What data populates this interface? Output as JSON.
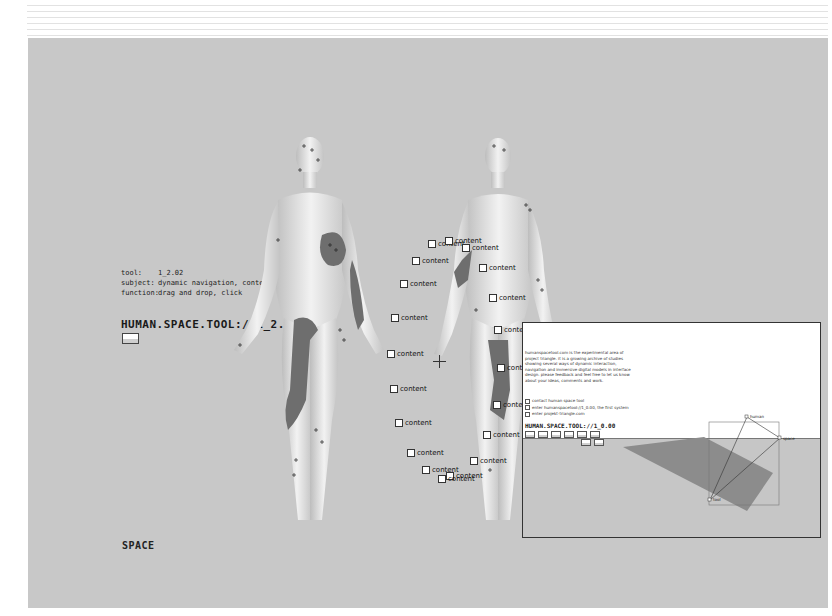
{
  "header": {
    "decoration": "horizontal-stripes"
  },
  "info": {
    "rows": [
      {
        "key": "tool:",
        "value": "1_2.02"
      },
      {
        "key": "subject:",
        "value": "dynamic navigation, contentmanagement"
      },
      {
        "key": "function:",
        "value": "drag and drop, click"
      }
    ],
    "title": "HUMAN.SPACE.TOOL://1_2.01"
  },
  "footer": {
    "label": "SPACE"
  },
  "content_nodes": [
    {
      "label": "content",
      "x": 400,
      "y": 202
    },
    {
      "label": "content",
      "x": 417,
      "y": 199
    },
    {
      "label": "content",
      "x": 434,
      "y": 206
    },
    {
      "label": "content",
      "x": 384,
      "y": 219
    },
    {
      "label": "content",
      "x": 451,
      "y": 226
    },
    {
      "label": "content",
      "x": 372,
      "y": 242
    },
    {
      "label": "content",
      "x": 461,
      "y": 256
    },
    {
      "label": "content",
      "x": 363,
      "y": 276
    },
    {
      "label": "content",
      "x": 466,
      "y": 288
    },
    {
      "label": "content",
      "x": 359,
      "y": 312
    },
    {
      "label": "content",
      "x": 469,
      "y": 326
    },
    {
      "label": "content",
      "x": 362,
      "y": 347
    },
    {
      "label": "content",
      "x": 465,
      "y": 363
    },
    {
      "label": "content",
      "x": 367,
      "y": 381
    },
    {
      "label": "content",
      "x": 455,
      "y": 393
    },
    {
      "label": "content",
      "x": 379,
      "y": 411
    },
    {
      "label": "content",
      "x": 442,
      "y": 419
    },
    {
      "label": "content",
      "x": 394,
      "y": 428
    },
    {
      "label": "content",
      "x": 418,
      "y": 434
    },
    {
      "label": "content",
      "x": 410,
      "y": 437
    }
  ],
  "popup": {
    "description": "humanspacetool.com is the experimental area of project triangle. it is a growing archive of studies showing several ways of dynamic interaction, navigation and immersive digital models in interface design. please feedback and feel free to let us know about your ideas, comments and work.",
    "links": [
      "contact human space tool",
      "enter humanspacetool://1_0.00, the first system",
      "enter projekt-triangle.com"
    ],
    "title": "HUMAN.SPACE.TOOL://1_0.00",
    "triangle": {
      "nodes": [
        "human",
        "space",
        "tool"
      ]
    }
  },
  "colors": {
    "stage": "#c8c8c8",
    "body_mark": "#6e6e6e",
    "figure": "#e6e6e6"
  }
}
